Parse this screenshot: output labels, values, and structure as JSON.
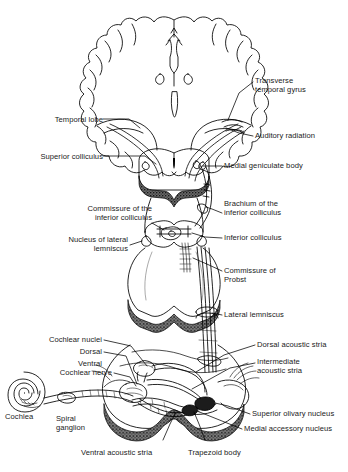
{
  "figure": {
    "background_color": "#ffffff",
    "line_color": "#000000",
    "label_color": "#1a1a1a",
    "shading_color": "#3a3a3a"
  },
  "labels": {
    "transverse_temporal_gyrus": "Transverse\ntemporal gyrus",
    "temporal_lobe": "Temporal lobe",
    "auditory_radiation": "Auditory radiation",
    "superior_colliculus": "Superior colliculus",
    "medial_geniculate_body": "Medial geniculate body",
    "commissure_inferior_colliculus": "Commissure of the\ninferior colliculus",
    "brachium_inferior_colliculus": "Brachium of the\ninferior colliculus",
    "inferior_colliculus": "Inferior colliculus",
    "nucleus_lateral_lemniscus": "Nucleus of lateral\nlemniscus",
    "commissure_of_probst": "Commissure of\nProbst",
    "lateral_lemniscus": "Lateral lemniscus",
    "cochlear_nuclei": "Cochlear nuclei",
    "cochlear_nuclei_dorsal": "Dorsal",
    "cochlear_nuclei_ventral": "Ventral",
    "cochlear_nerve": "Cochlear nerve",
    "cochlea": "Cochlea",
    "spiral_ganglion": "Spiral\nganglion",
    "dorsal_acoustic_stria": "Dorsal acoustic stria",
    "intermediate_acoustic_stria": "Intermediate\nacoustic stria",
    "ventral_acoustic_stria": "Ventral acoustic stria",
    "trapezoid_body": "Trapezoid body",
    "superior_olivary_nucleus": "Superior olivary nucleus",
    "medial_accessory_nucleus": "Medial accessory nucleus"
  }
}
